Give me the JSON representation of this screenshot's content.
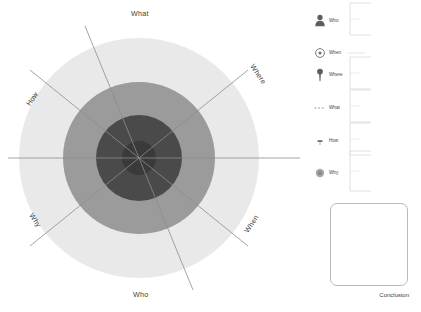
{
  "diagram": {
    "type": "concentric-bullseye",
    "center": {
      "x": 139,
      "y": 158
    },
    "rings": [
      {
        "name": "outer",
        "radius": 120,
        "color": "#e9e9e9"
      },
      {
        "name": "middle",
        "radius": 76,
        "color": "#9b9b9b"
      },
      {
        "name": "inner",
        "radius": 43,
        "color": "#4a4a4a"
      },
      {
        "name": "core",
        "radius": 17,
        "color": "#3a3a3a"
      }
    ],
    "axis_color": "#8d8d8d",
    "spokes": [
      {
        "id": "what",
        "label": "What",
        "angle_deg": 90,
        "label_x": 146,
        "label_y": 13,
        "rotate": 0
      },
      {
        "id": "where",
        "label": "Where",
        "angle_deg": 35,
        "label_x": 265,
        "label_y": 72,
        "rotate": 56
      },
      {
        "id": "when",
        "label": "When",
        "angle_deg": -35,
        "label_x": 255,
        "label_y": 222,
        "rotate": -56
      },
      {
        "id": "who",
        "label": "Who",
        "angle_deg": -90,
        "label_x": 147,
        "label_y": 295,
        "rotate": 0
      },
      {
        "id": "why",
        "label": "Why",
        "angle_deg": -145,
        "label_x": 43,
        "label_y": 222,
        "rotate": 56
      },
      {
        "id": "how",
        "label": "How",
        "angle_deg": 145,
        "label_x": 35,
        "label_y": 95,
        "rotate": -56
      }
    ]
  },
  "legend": {
    "items": [
      {
        "label": "Who",
        "icon": "person-icon",
        "top": 8,
        "bracket_height": 36
      },
      {
        "label": "When",
        "icon": "clock-icon",
        "top": 40,
        "bracket_height": 0
      },
      {
        "label": "Where",
        "icon": "map-pin-icon",
        "top": 62,
        "bracket_height": 36
      },
      {
        "label": "What",
        "icon": "dashed-line-icon",
        "top": 95,
        "bracket_height": 36
      },
      {
        "label": "How",
        "icon": "small-mark-icon",
        "top": 128,
        "bracket_height": 36
      },
      {
        "label": "Why",
        "icon": "filled-circle-icon",
        "top": 160,
        "bracket_height": 44
      }
    ],
    "bracket_color": "#dcdcdc",
    "icon_color": "#6b6b6b"
  },
  "conclusion": {
    "label": "Conclusion",
    "border_color": "#b9b9b9"
  }
}
